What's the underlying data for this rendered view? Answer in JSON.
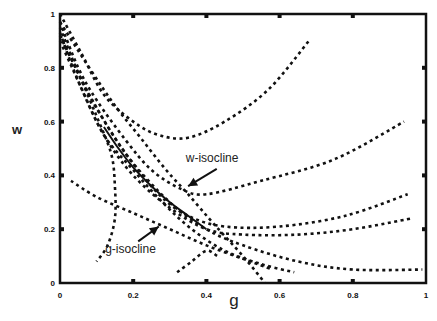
{
  "chart_data": {
    "type": "line",
    "title": "",
    "xlabel": "g",
    "ylabel": "w",
    "xlim": [
      0,
      1
    ],
    "ylim": [
      0,
      1
    ],
    "grid": false,
    "legend": null,
    "xticks": [
      "0",
      "0.2",
      "0.4",
      "0.6",
      "0.8",
      "1"
    ],
    "yticks": [
      "0",
      "0.2",
      "0.4",
      "0.6",
      "0.8",
      "1"
    ],
    "annotations": [
      {
        "text": "w-isocline",
        "x": 0.42,
        "y": 0.45,
        "arrow_to": [
          0.35,
          0.36
        ]
      },
      {
        "text": "g-isocline",
        "x": 0.2,
        "y": 0.11,
        "arrow_to": [
          0.27,
          0.21
        ]
      }
    ],
    "series": [
      {
        "name": "w-isocline",
        "style": "dotted",
        "points": [
          [
            0.0,
            0.97
          ],
          [
            0.08,
            0.8
          ],
          [
            0.15,
            0.66
          ],
          [
            0.22,
            0.54
          ],
          [
            0.29,
            0.42
          ],
          [
            0.35,
            0.33
          ],
          [
            0.42,
            0.22
          ],
          [
            0.5,
            0.1
          ],
          [
            0.56,
            0.0
          ]
        ]
      },
      {
        "name": "g-isocline",
        "style": "dotted",
        "points": [
          [
            0.03,
            0.38
          ],
          [
            0.1,
            0.32
          ],
          [
            0.2,
            0.26
          ],
          [
            0.3,
            0.2
          ],
          [
            0.4,
            0.14
          ],
          [
            0.5,
            0.09
          ],
          [
            0.58,
            0.05
          ]
        ]
      },
      {
        "name": "separatrix",
        "style": "solid",
        "points": [
          [
            0.12,
            0.58
          ],
          [
            0.16,
            0.5
          ],
          [
            0.2,
            0.43
          ],
          [
            0.25,
            0.36
          ],
          [
            0.3,
            0.3
          ],
          [
            0.35,
            0.25
          ],
          [
            0.4,
            0.2
          ]
        ]
      },
      {
        "name": "trajectory-1",
        "style": "dotted",
        "points": [
          [
            0.0,
            1.0
          ],
          [
            0.06,
            0.85
          ],
          [
            0.12,
            0.7
          ],
          [
            0.2,
            0.6
          ],
          [
            0.27,
            0.55
          ],
          [
            0.35,
            0.54
          ],
          [
            0.45,
            0.6
          ],
          [
            0.57,
            0.72
          ],
          [
            0.68,
            0.9
          ]
        ]
      },
      {
        "name": "trajectory-2",
        "style": "dotted",
        "points": [
          [
            0.0,
            0.97
          ],
          [
            0.05,
            0.8
          ],
          [
            0.1,
            0.68
          ],
          [
            0.18,
            0.53
          ],
          [
            0.25,
            0.42
          ],
          [
            0.33,
            0.35
          ],
          [
            0.4,
            0.33
          ],
          [
            0.55,
            0.38
          ],
          [
            0.75,
            0.46
          ],
          [
            0.94,
            0.6
          ]
        ]
      },
      {
        "name": "trajectory-3",
        "style": "dotted",
        "points": [
          [
            0.0,
            0.95
          ],
          [
            0.05,
            0.78
          ],
          [
            0.1,
            0.65
          ],
          [
            0.18,
            0.48
          ],
          [
            0.27,
            0.33
          ],
          [
            0.35,
            0.25
          ],
          [
            0.45,
            0.21
          ],
          [
            0.6,
            0.21
          ],
          [
            0.78,
            0.25
          ],
          [
            0.95,
            0.33
          ]
        ]
      },
      {
        "name": "trajectory-4",
        "style": "dotted",
        "points": [
          [
            0.0,
            0.93
          ],
          [
            0.05,
            0.75
          ],
          [
            0.12,
            0.55
          ],
          [
            0.2,
            0.4
          ],
          [
            0.3,
            0.28
          ],
          [
            0.4,
            0.2
          ],
          [
            0.5,
            0.18
          ],
          [
            0.65,
            0.18
          ],
          [
            0.8,
            0.2
          ],
          [
            0.96,
            0.24
          ]
        ]
      },
      {
        "name": "trajectory-5",
        "style": "dotted",
        "points": [
          [
            0.0,
            0.92
          ],
          [
            0.08,
            0.7
          ],
          [
            0.18,
            0.48
          ],
          [
            0.3,
            0.3
          ],
          [
            0.4,
            0.2
          ],
          [
            0.5,
            0.14
          ],
          [
            0.65,
            0.08
          ],
          [
            0.8,
            0.05
          ],
          [
            0.99,
            0.05
          ]
        ]
      },
      {
        "name": "trajectory-6",
        "style": "dotted",
        "points": [
          [
            0.0,
            0.9
          ],
          [
            0.06,
            0.72
          ],
          [
            0.12,
            0.55
          ],
          [
            0.2,
            0.42
          ],
          [
            0.28,
            0.3
          ],
          [
            0.36,
            0.2
          ],
          [
            0.45,
            0.12
          ],
          [
            0.55,
            0.07
          ],
          [
            0.64,
            0.04
          ]
        ]
      },
      {
        "name": "trajectory-7",
        "style": "dotted",
        "points": [
          [
            0.0,
            0.92
          ],
          [
            0.05,
            0.78
          ],
          [
            0.1,
            0.62
          ],
          [
            0.14,
            0.48
          ],
          [
            0.15,
            0.36
          ],
          [
            0.15,
            0.24
          ],
          [
            0.13,
            0.14
          ],
          [
            0.1,
            0.08
          ]
        ]
      },
      {
        "name": "trajectory-8",
        "style": "dotted",
        "points": [
          [
            0.32,
            0.04
          ],
          [
            0.36,
            0.08
          ],
          [
            0.4,
            0.12
          ],
          [
            0.43,
            0.1
          ]
        ]
      }
    ]
  }
}
